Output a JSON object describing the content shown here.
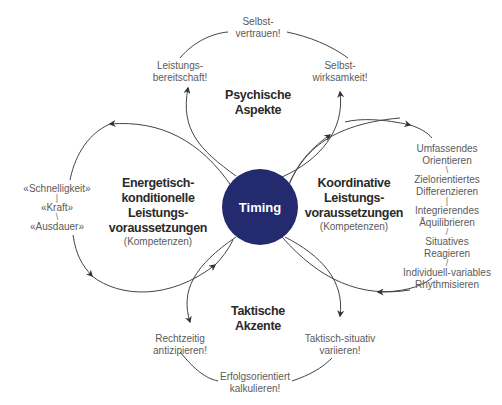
{
  "center": {
    "label": "Timing",
    "color": "#232a6e"
  },
  "sections": {
    "top": {
      "title": [
        "Psychische",
        "Aspekte"
      ],
      "items": [
        "Selbst-\nvertrauen!",
        "Leistungs-\nbereitschaft!",
        "Selbst-\nwirksamkeit!"
      ]
    },
    "left": {
      "title": [
        "Energetisch-",
        "konditionelle",
        "Leistungs-",
        "voraussetzungen"
      ],
      "subtitle": "(Kompetenzen)",
      "items": [
        "«Schnelligkeit»",
        "«Kraft»",
        "«Ausdauer»"
      ]
    },
    "right": {
      "title": [
        "Koordinative",
        "Leistungs-",
        "voraussetzungen"
      ],
      "subtitle": "(Kompetenzen)",
      "items": [
        "Umfassendes",
        "Orientieren",
        "Zielorientiertes",
        "Differenzieren",
        "Integrierendes",
        "Äquilibrieren",
        "Situatives",
        "Reagieren",
        "Individuell-variables",
        "Rhythmisieren"
      ]
    },
    "bottom": {
      "title": [
        "Taktische",
        "Akzente"
      ],
      "items": [
        "Rechtzeitig",
        "antizipieren!",
        "Taktisch-situativ",
        "variieren!",
        "Erfolgsorientiert",
        "kalkulieren!"
      ]
    }
  },
  "top_items": {
    "selbstvertrauen_1": "Selbst-",
    "selbstvertrauen_2": "vertrauen!",
    "leistungs_1": "Leistungs-",
    "leistungs_2": "bereitschaft!",
    "wirksam_1": "Selbst-",
    "wirksam_2": "wirksamkeit!"
  }
}
